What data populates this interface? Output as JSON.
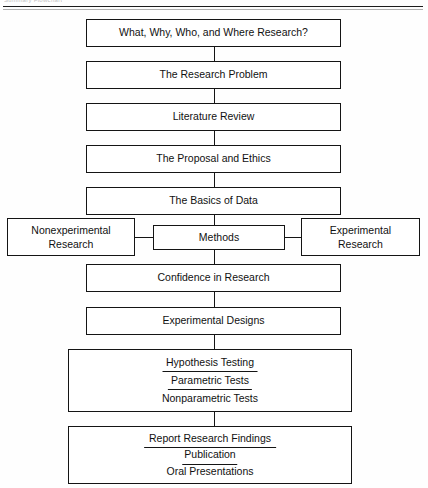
{
  "page": {
    "running_head": "Summary  Flowchart",
    "background": "#fefefe",
    "ink": "#141414"
  },
  "flow": {
    "nodes": [
      {
        "id": "n1",
        "label": "What, Why, Who, and Where Research?"
      },
      {
        "id": "n2",
        "label": "The Research Problem"
      },
      {
        "id": "n3",
        "label": "Literature Review"
      },
      {
        "id": "n4",
        "label": "The Proposal and Ethics"
      },
      {
        "id": "n5",
        "label": "The Basics of Data"
      },
      {
        "id": "n6",
        "label": "Methods"
      },
      {
        "id": "n7",
        "line1": "Nonexperimental",
        "line2": "Research"
      },
      {
        "id": "n8",
        "line1": "Experimental",
        "line2": "Research"
      },
      {
        "id": "n9",
        "label": "Confidence in Research"
      },
      {
        "id": "n10",
        "label": "Experimental Designs"
      },
      {
        "id": "n11",
        "line1": "Hypothesis Testing",
        "line2": "Parametric Tests",
        "line3": "Nonparametric Tests"
      },
      {
        "id": "n12",
        "line1": "Report Research Findings",
        "line2": "Publication",
        "line3": "Oral Presentations"
      }
    ]
  }
}
